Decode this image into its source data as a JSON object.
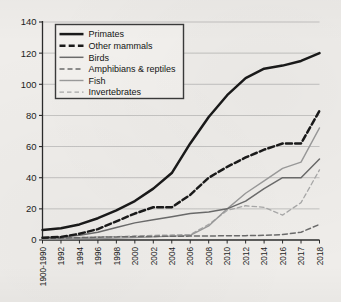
{
  "chart_data": {
    "type": "line",
    "title": "",
    "xlabel": "",
    "ylabel": "",
    "ylim": [
      0,
      140
    ],
    "yticks": [
      0,
      20,
      40,
      60,
      80,
      100,
      120,
      140
    ],
    "grid": true,
    "legend_position": "top-left",
    "categories": [
      "1900-1990",
      "1992",
      "1994",
      "1996",
      "1998",
      "2000",
      "2002",
      "2004",
      "2006",
      "2008",
      "2010",
      "2012",
      "2014",
      "2016",
      "2017",
      "2018"
    ],
    "series": [
      {
        "name": "Primates",
        "style": "solid-thick",
        "color": "#1a1a1a",
        "values": [
          6.5,
          7.5,
          10,
          14,
          19,
          25,
          33,
          43,
          62,
          79,
          93,
          104,
          110,
          112,
          115,
          120
        ]
      },
      {
        "name": "Other mammals",
        "style": "dashed-thick",
        "color": "#1a1a1a",
        "values": [
          1.5,
          2,
          4,
          7,
          12,
          17,
          21,
          21,
          29,
          40,
          47,
          53,
          58,
          62,
          62,
          83
        ]
      },
      {
        "name": "Birds",
        "style": "solid-medium",
        "color": "#6b6b6b",
        "values": [
          1.5,
          2,
          3,
          5,
          8,
          11,
          13,
          15,
          17,
          18,
          20,
          25,
          33,
          40,
          40,
          52
        ]
      },
      {
        "name": "Amphibians & reptiles",
        "style": "dashed-medium",
        "color": "#6b6b6b",
        "values": [
          1,
          1.2,
          1.5,
          1.8,
          2,
          2.2,
          2.3,
          2.4,
          2.5,
          2.6,
          2.7,
          2.8,
          3,
          3.5,
          5,
          10
        ]
      },
      {
        "name": "Fish",
        "style": "solid-light",
        "color": "#9a9a9a",
        "values": [
          0.5,
          0.6,
          0.8,
          1,
          1.2,
          1.5,
          2,
          2.5,
          3,
          9,
          20,
          30,
          38,
          46,
          50,
          72
        ]
      },
      {
        "name": "Invertebrates",
        "style": "dashed-light",
        "color": "#a8a8a8",
        "values": [
          1,
          1.3,
          1.6,
          2,
          2.2,
          2.6,
          3,
          3.2,
          3.5,
          10,
          19,
          22,
          21,
          16,
          24,
          45
        ]
      }
    ]
  },
  "legend": {
    "items": [
      {
        "label": "Primates"
      },
      {
        "label": "Other mammals"
      },
      {
        "label": "Birds"
      },
      {
        "label": "Amphibians & reptiles"
      },
      {
        "label": "Fish"
      },
      {
        "label": "Invertebrates"
      }
    ]
  }
}
